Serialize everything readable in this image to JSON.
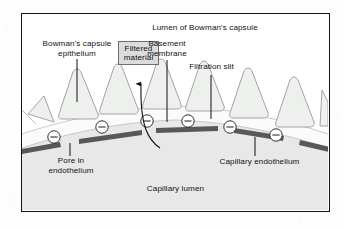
{
  "figure": {
    "frame_border_color": "#141414",
    "background_color": "#ffffff"
  },
  "labels": {
    "lumen_bowmans_capsule": "Lumen of Bowman's capsule",
    "bowmans_capsule_epithelium": "Bowman's capsule\nepithelium",
    "filtered_material": "Filtered\nmaterial",
    "basement_membrane": "Basement\nmembrane",
    "filtration_slit": "Filtration slit",
    "pore_in_endothelium": "Pore in\nendothelium",
    "capillary_endothelium": "Capillary endothelium",
    "capillary_lumen": "Capillary lumen"
  },
  "charge_markers": {
    "symbol": "−",
    "count": 6,
    "meaning": "negative-charge"
  },
  "colors": {
    "foot_process_fill": "#eef0ee",
    "foot_process_stroke": "#9a9a9a",
    "endothelium_bar": "#585858",
    "capillary_lumen_fill": "#e8e8e8",
    "basement_membrane_band": "#fbfbfb",
    "leader_line": "#111111",
    "filtered_material_box_fill": "#dcdcdc",
    "filtered_material_box_border": "#6e6e6e",
    "frame_border": "#141414"
  },
  "structures": {
    "foot_processes_visible": 7,
    "endothelium_pores_visible": 5,
    "filtration_arrow": "curved-arrow-upward"
  }
}
